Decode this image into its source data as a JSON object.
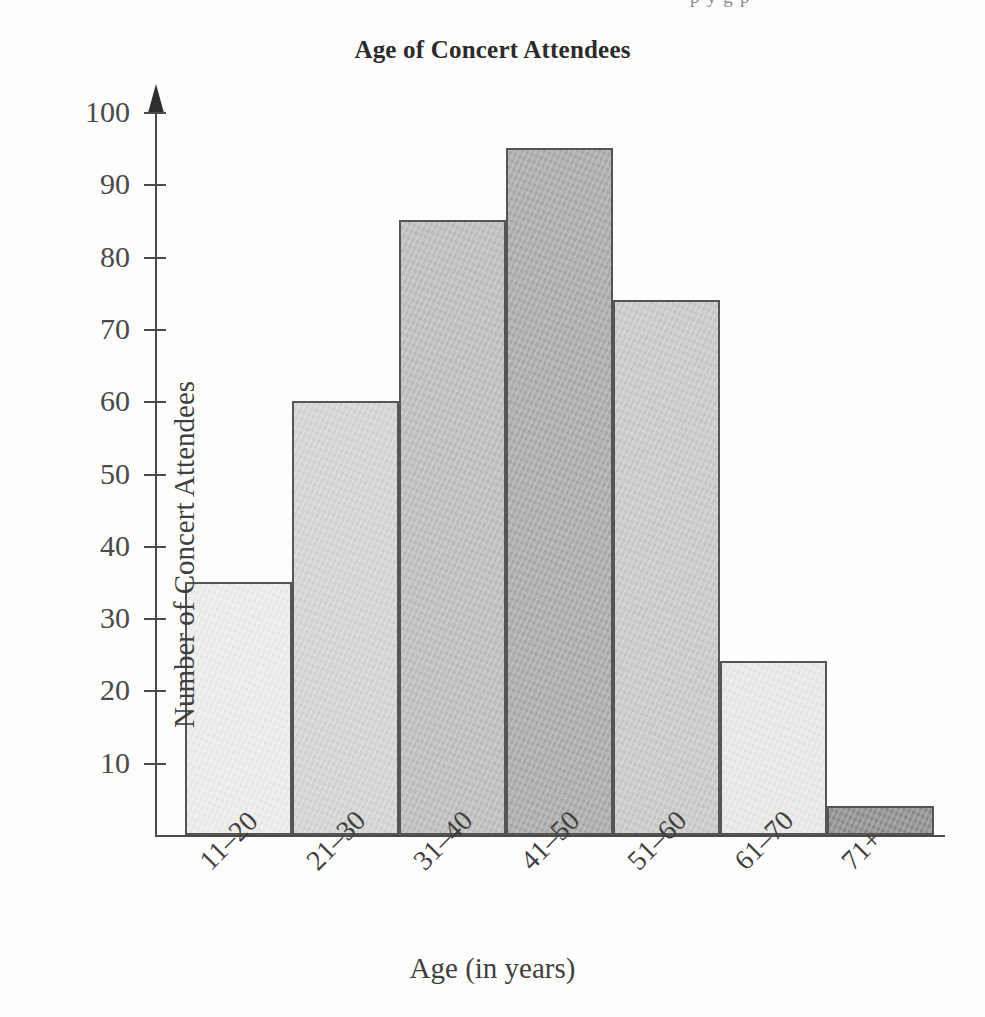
{
  "top_bleed_text": "p y g p",
  "chart_data": {
    "type": "bar",
    "title": "Age of Concert Attendees",
    "xlabel": "Age (in years)",
    "ylabel": "Number of Concert Attendees",
    "categories": [
      "11–20",
      "21–30",
      "31–40",
      "41–50",
      "51–60",
      "61–70",
      "71+"
    ],
    "values": [
      35,
      60,
      85,
      95,
      74,
      24,
      4
    ],
    "bar_colors": [
      "#ededeb",
      "#d4d4d2",
      "#bdbdbb",
      "#a9a9a7",
      "#c9c9c7",
      "#e9e9e7",
      "#8d8d8b"
    ],
    "bar_border_color": "#555555",
    "ylim": [
      0,
      100
    ],
    "ytick_labels": [
      "10",
      "20",
      "30",
      "40",
      "50",
      "60",
      "70",
      "80",
      "90",
      "100"
    ],
    "ytick_values": [
      10,
      20,
      30,
      40,
      50,
      60,
      70,
      80,
      90,
      100
    ],
    "grid": false,
    "legend": "none",
    "axis_color": "#4b4b4b",
    "y_axis_arrow": true
  }
}
